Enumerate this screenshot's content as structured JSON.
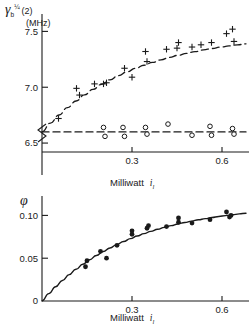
{
  "figure": {
    "title": "",
    "background_color": "#ffffff",
    "ink_color": "#1a1a1a"
  },
  "chart_data": [
    {
      "id": "top-panel",
      "type": "scatter",
      "title": "",
      "xlabel": "Milliwatt",
      "xlabel_symbol": "i",
      "xlabel_symbol_sub": "l",
      "ylabel": "(2)",
      "ylabel_symbol": "γ",
      "ylabel_symbol_sub": "b",
      "ylabel_symbol_sup": "¼",
      "yunit": "(MHz)",
      "xlim": [
        0.0,
        0.68
      ],
      "ylim": [
        6.42,
        7.62
      ],
      "xticks": [
        0.3,
        0.6
      ],
      "xtick_labels": [
        "0.3",
        "0.6"
      ],
      "yticks": [
        6.5,
        7.0,
        7.5
      ],
      "ytick_labels": [
        "6.5",
        "7.0",
        "7.5"
      ],
      "axis_break": true,
      "grid": false,
      "legend": "none",
      "series": [
        {
          "name": "upper-branch",
          "marker": "plus",
          "line": "dashed",
          "x": [
            0.055,
            0.115,
            0.125,
            0.175,
            0.205,
            0.215,
            0.275,
            0.3,
            0.345,
            0.35,
            0.415,
            0.45,
            0.455,
            0.5,
            0.53,
            0.565,
            0.615,
            0.635,
            0.64
          ],
          "y": [
            6.72,
            6.99,
            6.93,
            7.03,
            7.03,
            7.04,
            7.17,
            7.09,
            7.32,
            7.23,
            7.34,
            7.35,
            7.4,
            7.36,
            7.38,
            7.4,
            7.48,
            7.52,
            7.41
          ]
        },
        {
          "name": "lower-branch",
          "marker": "circle",
          "line": "dashed",
          "x": [
            0.205,
            0.21,
            0.27,
            0.275,
            0.345,
            0.35,
            0.42,
            0.5,
            0.56,
            0.565,
            0.635,
            0.64
          ],
          "y": [
            6.64,
            6.56,
            6.64,
            6.56,
            6.64,
            6.58,
            6.67,
            6.57,
            6.65,
            6.57,
            6.63,
            6.58
          ]
        }
      ],
      "fit_lines": [
        {
          "name": "upper-fit",
          "style": "dashed",
          "description": "rising saturating curve through plus markers"
        },
        {
          "name": "lower-fit",
          "style": "dashed",
          "description": "flat horizontal line at 6.60 MHz through open circles"
        }
      ]
    },
    {
      "id": "bottom-panel",
      "type": "scatter",
      "title": "",
      "xlabel": "Milliwatt",
      "xlabel_symbol": "i",
      "xlabel_symbol_sub": "l",
      "ylabel_symbol": "φ",
      "xlim": [
        0.0,
        0.68
      ],
      "ylim": [
        0.0,
        0.118
      ],
      "xticks": [
        0.3,
        0.6
      ],
      "xtick_labels": [
        "0.3",
        "0.6"
      ],
      "yticks": [
        0.0,
        0.05,
        0.1
      ],
      "ytick_labels": [
        "0",
        "0.05",
        "0.10"
      ],
      "grid": false,
      "legend": "none",
      "series": [
        {
          "name": "phi-points",
          "marker": "filled-circle",
          "x": [
            0.145,
            0.15,
            0.195,
            0.215,
            0.25,
            0.3,
            0.3,
            0.35,
            0.355,
            0.415,
            0.455,
            0.455,
            0.5,
            0.56,
            0.615,
            0.625,
            0.63
          ],
          "y": [
            0.04,
            0.047,
            0.058,
            0.05,
            0.065,
            0.078,
            0.082,
            0.085,
            0.088,
            0.087,
            0.092,
            0.097,
            0.091,
            0.095,
            0.104,
            0.098,
            0.1
          ]
        }
      ],
      "fit_lines": [
        {
          "name": "phi-fit",
          "style": "solid",
          "description": "smooth saturating curve from origin rising to about 0.10"
        }
      ]
    }
  ]
}
